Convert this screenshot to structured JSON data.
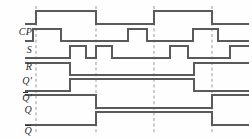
{
  "figure": {
    "kind": "digital-timing-diagram",
    "width": 252,
    "height": 139,
    "background_color": "#fefefe",
    "trace_color": "#5a5a5a",
    "label_color": "#2b2b2b",
    "dash_color": "#9a9a9a"
  },
  "labels": {
    "cp": "CP",
    "s": "S",
    "r": "R",
    "q_prime_base": "Q",
    "q_prime_mark": "'",
    "qbar_prime_base": "Q",
    "qbar_prime_mark": "'",
    "q": "Q",
    "qbar": "Q"
  },
  "chart_data": {
    "type": "line",
    "title": "",
    "xlabel": "",
    "ylabel": "",
    "x": [
      25,
      252
    ],
    "signals": [
      {
        "name": "CP",
        "label": "CP",
        "row": 0,
        "high_y": 11,
        "low_y": 24,
        "initial_level": 0,
        "transitions": [
          {
            "x": 36,
            "level": 1
          },
          {
            "x": 96,
            "level": 0
          },
          {
            "x": 154,
            "level": 1
          },
          {
            "x": 212,
            "level": 0
          }
        ]
      },
      {
        "name": "S",
        "label": "S",
        "row": 1,
        "high_y": 29,
        "low_y": 41,
        "initial_level": 0,
        "transitions": [
          {
            "x": 33,
            "level": 1
          },
          {
            "x": 61,
            "level": 0
          },
          {
            "x": 128,
            "level": 1
          },
          {
            "x": 147,
            "level": 0
          },
          {
            "x": 193,
            "level": 1
          },
          {
            "x": 218,
            "level": 0
          }
        ]
      },
      {
        "name": "R",
        "label": "R",
        "row": 2,
        "high_y": 46,
        "low_y": 58,
        "initial_level": 0,
        "transitions": [
          {
            "x": 70,
            "level": 1
          },
          {
            "x": 86,
            "level": 0
          },
          {
            "x": 96,
            "level": 1
          },
          {
            "x": 112,
            "level": 0
          },
          {
            "x": 170,
            "level": 1
          },
          {
            "x": 188,
            "level": 0
          },
          {
            "x": 230,
            "level": 1
          }
        ]
      },
      {
        "name": "Qp",
        "label": "Q'",
        "row": 3,
        "high_y": 63,
        "low_y": 75,
        "initial_level": 1,
        "transitions": [
          {
            "x": 70,
            "level": 0
          },
          {
            "x": 194,
            "level": 1
          }
        ]
      },
      {
        "name": "Qpbar",
        "label": "Q'bar",
        "row": 4,
        "high_y": 79,
        "low_y": 91,
        "initial_level": 0,
        "transitions": [
          {
            "x": 70,
            "level": 1
          },
          {
            "x": 194,
            "level": 0
          }
        ]
      },
      {
        "name": "Q",
        "label": "Q",
        "row": 5,
        "high_y": 95,
        "low_y": 108,
        "initial_level": 1,
        "transitions": [
          {
            "x": 96,
            "level": 0
          },
          {
            "x": 212,
            "level": 1
          }
        ]
      },
      {
        "name": "Qbar",
        "label": "Qbar",
        "row": 6,
        "high_y": 112,
        "low_y": 125,
        "initial_level": 0,
        "transitions": [
          {
            "x": 96,
            "level": 1
          },
          {
            "x": 212,
            "level": 0
          }
        ]
      }
    ],
    "clock_edge_markers": [
      36,
      96,
      154,
      212
    ],
    "marker_y_top": 6,
    "marker_y_bottom": 133,
    "trace_start_x": 25,
    "trace_end_x": 249,
    "grid": false,
    "legend": "none"
  }
}
